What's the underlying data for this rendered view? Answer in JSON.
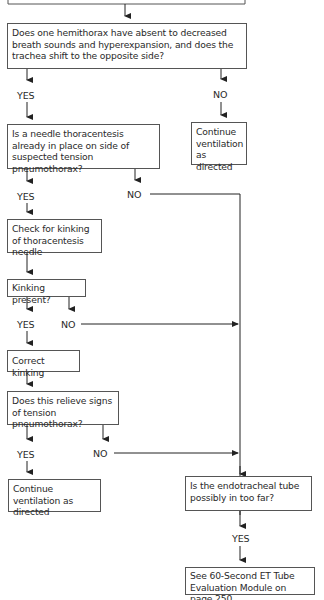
{
  "flowchart": {
    "top_box_partial": "",
    "q_hemithorax": "Does one hemithorax have absent to decreased breath sounds and hyperexpansion, and does the trachea shift to the opposite side?",
    "q_hemithorax_yes": "YES",
    "q_hemithorax_no": "NO",
    "continue_1": "Continue ventilation as directed",
    "q_needle": "Is a needle thoracentesis already in place on side of suspected tension pneumothorax?",
    "q_needle_yes": "YES",
    "q_needle_no": "NO",
    "check_kinking": "Check for kinking of thoracentesis needle",
    "q_kinking": "Kinking present?",
    "q_kinking_yes": "YES",
    "q_kinking_no": "NO",
    "correct_kinking": "Correct kinking",
    "q_relieve": "Does this relieve signs of tension pneumothorax?",
    "q_relieve_yes": "YES",
    "q_relieve_no": "NO",
    "continue_2": "Continue ventilation as directed",
    "q_et_tube": "Is the endotracheal tube possibly in too far?",
    "q_et_tube_yes": "YES",
    "see_module": "See 60-Second ET Tube Evaluation Module on page 250"
  }
}
